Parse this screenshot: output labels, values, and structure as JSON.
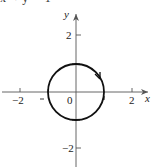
{
  "figure": {
    "type": "unit-circle-parametric-curve",
    "caption_fragment": "x² + y² = 1",
    "axes": {
      "x_label": "x",
      "y_label": "y",
      "x_ticks": [
        {
          "value": -2,
          "label": "−2"
        },
        {
          "value": -1,
          "label": "−1"
        },
        {
          "value": 2,
          "label": "2"
        }
      ],
      "y_ticks": [
        {
          "value": 2,
          "label": "2"
        },
        {
          "value": 1,
          "label": "1"
        },
        {
          "value": -1,
          "label": "−1"
        },
        {
          "value": -2,
          "label": "−2"
        }
      ],
      "origin_label": "0",
      "range": {
        "x": [
          -2.5,
          2.5
        ],
        "y": [
          -2.5,
          2.5
        ]
      }
    },
    "curve": {
      "shape": "circle",
      "center": [
        0,
        0
      ],
      "radius": 1,
      "orientation": "clockwise",
      "arrow_position": "upper-right"
    },
    "colors": {
      "curve": "#111111",
      "axes": "#555555",
      "labels": "#222222"
    }
  }
}
